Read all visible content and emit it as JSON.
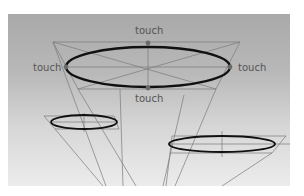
{
  "figure": {
    "background_color": "#b8b8b8",
    "labels": {
      "top": "touch",
      "left": "touch",
      "right": "touch",
      "bottom": "touch"
    },
    "colors": {
      "ellipse_stroke": "#111111",
      "guide_line": "#7a7a7a",
      "touch_point": "#6a6a6a",
      "label_text": "#555555"
    },
    "shapes": {
      "large_ellipse": {
        "cx": 148,
        "cy": 67,
        "rx": 82,
        "ry": 20
      },
      "small_left_ellipse": {
        "cx": 84,
        "cy": 122,
        "rx": 33,
        "ry": 7
      },
      "small_right_ellipse": {
        "cx": 222,
        "cy": 144,
        "rx": 53,
        "ry": 8
      }
    }
  }
}
